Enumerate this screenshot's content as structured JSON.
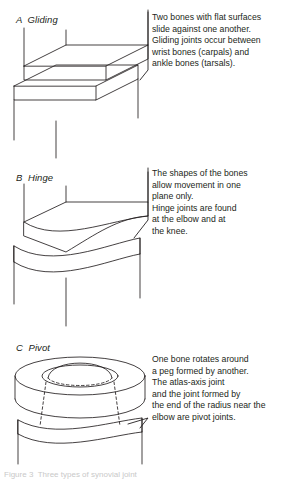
{
  "figure": {
    "panels": [
      {
        "id": "gliding",
        "label": "A  Gliding",
        "description": "Two bones with flat surfaces\nslide against one another.\nGliding joints occur between\nwrist bones (carpals) and\nankle bones (tarsals).",
        "illustration": "two-flat-slabs-gliding-joint"
      },
      {
        "id": "hinge",
        "label": "B  Hinge",
        "description": "The shapes of the bones\nallow movement in one\nplane only.\nHinge joints are found\nat the elbow and at\nthe knee.",
        "illustration": "curved-convex-block-on-concave-block-hinge-joint"
      },
      {
        "id": "pivot",
        "label": "C  Pivot",
        "description": "One bone rotates around\na peg formed by another.\nThe atlas-axis joint\nand the joint formed by\nthe end of the radius near the\nelbow are pivot joints.",
        "illustration": "ring-cylinder-with-central-peg-pivot-joint"
      }
    ],
    "footer_caption": "Figure 3  Three types of synovial joint",
    "colors": {
      "ink": "#231f20",
      "background": "#ffffff",
      "faint_caption": "#c9c9c9"
    }
  }
}
